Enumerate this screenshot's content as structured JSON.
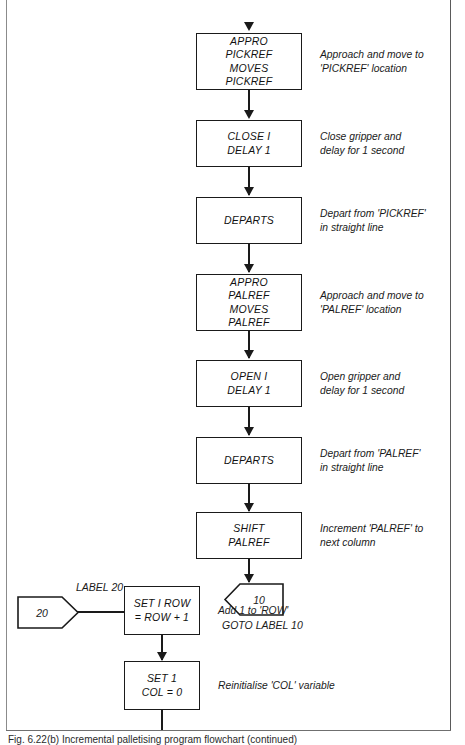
{
  "figure": {
    "caption": "Fig. 6.22(b) Incremental palletising program flowchart (continued)",
    "frame_color": "#6f6f6f",
    "ink_color": "#1a1a1a"
  },
  "flow": {
    "steps": [
      {
        "id": "appro-pickref",
        "shape": "process",
        "lines": [
          "APPRO",
          "PICKREF",
          "MOVES",
          "PICKREF"
        ],
        "note": [
          "Approach and move to",
          "'PICKREF' location"
        ]
      },
      {
        "id": "close-delay",
        "shape": "process",
        "lines": [
          "CLOSE I",
          "DELAY 1"
        ],
        "note": [
          "Close gripper and",
          "delay for 1 second"
        ]
      },
      {
        "id": "departs-pickref",
        "shape": "process",
        "lines": [
          "DEPARTS"
        ],
        "note": [
          "Depart from 'PICKREF'",
          "in straight line"
        ]
      },
      {
        "id": "appro-palref",
        "shape": "process",
        "lines": [
          "APPRO",
          "PALREF",
          "MOVES",
          "PALREF"
        ],
        "note": [
          "Approach and move to",
          "'PALREF' location"
        ]
      },
      {
        "id": "open-delay",
        "shape": "process",
        "lines": [
          "OPEN I",
          "DELAY 1"
        ],
        "note": [
          "Open gripper and",
          "delay for 1 second"
        ]
      },
      {
        "id": "departs-palref",
        "shape": "process",
        "lines": [
          "DEPARTS"
        ],
        "note": [
          "Depart from 'PALREF'",
          "in straight line"
        ]
      },
      {
        "id": "shift-palref",
        "shape": "process",
        "lines": [
          "SHIFT",
          "PALREF"
        ],
        "note": [
          "Increment 'PALREF' to",
          "next column"
        ]
      },
      {
        "id": "set-row",
        "shape": "process",
        "lines": [
          "SET I ROW",
          "= ROW + 1"
        ],
        "note": [
          "Add 1 to 'ROW'"
        ]
      },
      {
        "id": "set-col",
        "shape": "process",
        "lines": [
          "SET 1",
          "COL = 0"
        ],
        "note": [
          "Reinitialise 'COL' variable"
        ]
      }
    ],
    "connectors": [
      {
        "id": "goto-10",
        "value": "10",
        "direction": "point-left",
        "caption": "GOTO LABEL 10"
      },
      {
        "id": "label-20",
        "value": "20",
        "direction": "point-right",
        "caption": "LABEL 20"
      }
    ]
  }
}
